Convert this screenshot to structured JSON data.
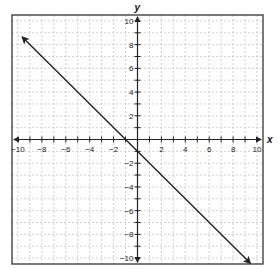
{
  "chart_data": {
    "type": "line",
    "title": "",
    "xlabel": "x",
    "ylabel": "y",
    "xlim": [
      -10.5,
      10.5
    ],
    "ylim": [
      -10.5,
      10.5
    ],
    "grid": true,
    "grid_step": 1,
    "x_ticks": [
      -10,
      -8,
      -6,
      -4,
      -2,
      2,
      4,
      6,
      8,
      10
    ],
    "y_ticks": [
      -10,
      -8,
      -6,
      -4,
      -2,
      2,
      4,
      6,
      8,
      10
    ],
    "x_tick_labels": [
      "−10",
      "−8",
      "−6",
      "−4",
      "−2",
      "2",
      "4",
      "6",
      "8",
      "10"
    ],
    "y_tick_labels": [
      "−10",
      "−8",
      "−6",
      "−4",
      "−2",
      "2",
      "4",
      "6",
      "8",
      "10"
    ],
    "series": [
      {
        "name": "line",
        "equation": "y = -x - 1",
        "slope": -1,
        "intercept": -1,
        "x": [
          -9.6,
          9.4
        ],
        "y": [
          8.6,
          -10.4
        ],
        "arrows": "both"
      }
    ],
    "colors": {
      "line": "#222222",
      "grid": "#bdbdbd",
      "frame": "#333333",
      "axis": "#222222"
    }
  }
}
